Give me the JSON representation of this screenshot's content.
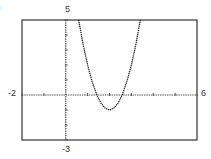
{
  "panel": {
    "tag": ")"
  },
  "labels": {
    "ymax": "5",
    "ymin": "-3",
    "xmin": "-2",
    "xmax": "6"
  },
  "colors": {
    "frame": "#333333",
    "axis": "#555555",
    "curve": "#333333"
  },
  "chart_data": {
    "type": "line",
    "title": "",
    "xlabel": "",
    "ylabel": "",
    "xlim": [
      -2,
      6
    ],
    "ylim": [
      -3,
      5
    ],
    "xscale": 1,
    "yscale": 1,
    "grid": false,
    "legend": null,
    "annotations": [
      "window labels: xmin -2, xmax 6, ymin -3, ymax 5"
    ],
    "series": [
      {
        "name": "parabola (approx. y = 3(x-2)^2 - 1)",
        "x": [
          0.59,
          0.8,
          1.0,
          1.2,
          1.42,
          1.6,
          1.8,
          2.0,
          2.2,
          2.4,
          2.58,
          2.8,
          3.0,
          3.2,
          3.41
        ],
        "y": [
          5.0,
          3.32,
          2.0,
          0.92,
          0.0,
          -0.52,
          -0.88,
          -1.0,
          -0.88,
          -0.52,
          0.0,
          0.92,
          2.0,
          3.32,
          5.0
        ]
      }
    ]
  }
}
